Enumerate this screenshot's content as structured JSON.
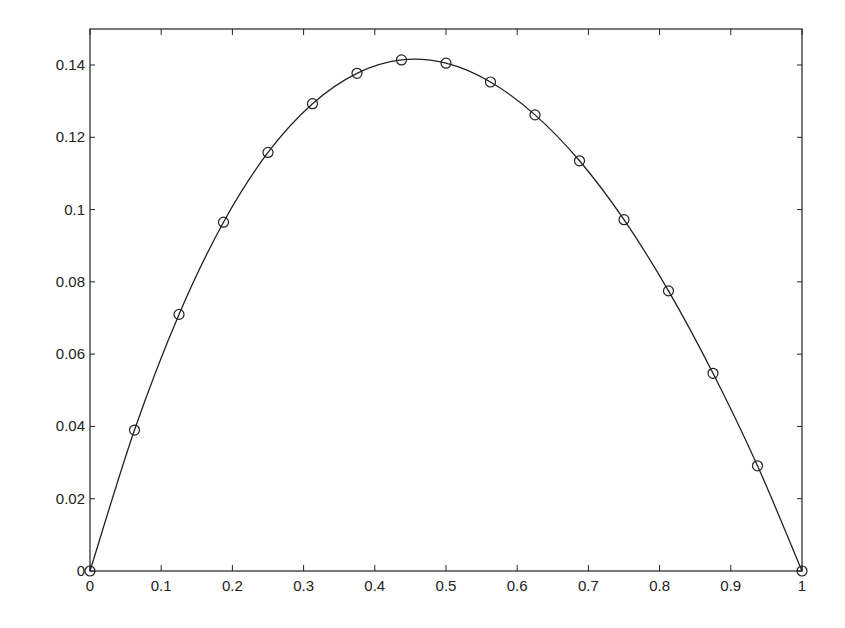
{
  "chart_data": {
    "type": "line",
    "title": "",
    "xlabel": "",
    "ylabel": "",
    "xlim": [
      0,
      1
    ],
    "ylim": [
      0,
      0.15
    ],
    "grid": false,
    "legend": null,
    "x_ticks": [
      "0",
      "0.1",
      "0.2",
      "0.3",
      "0.4",
      "0.5",
      "0.6",
      "0.7",
      "0.8",
      "0.9",
      "1"
    ],
    "y_ticks": [
      "0",
      "0.02",
      "0.04",
      "0.06",
      "0.08",
      "0.1",
      "0.12",
      "0.14"
    ],
    "series": [
      {
        "name": "curve",
        "style": "solid line with circle markers",
        "color": "#222222",
        "x": [
          0,
          0.0625,
          0.125,
          0.1875,
          0.25,
          0.3125,
          0.375,
          0.4375,
          0.5,
          0.5625,
          0.625,
          0.6875,
          0.75,
          0.8125,
          0.875,
          0.9375,
          1
        ],
        "values": [
          0,
          0.039,
          0.071,
          0.0965,
          0.1158,
          0.1293,
          0.1377,
          0.1414,
          0.1405,
          0.1353,
          0.1262,
          0.1135,
          0.0972,
          0.0775,
          0.0547,
          0.0291,
          0
        ]
      }
    ]
  }
}
